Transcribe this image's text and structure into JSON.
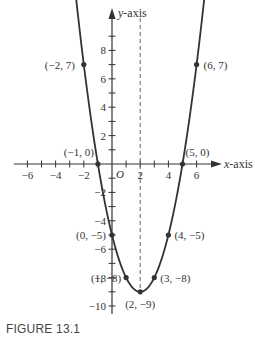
{
  "caption": "FIGURE 13.1",
  "chart_data": {
    "type": "line",
    "title": "",
    "function": "y = x^2 - 4x - 5",
    "xlabel": "x-axis",
    "ylabel": "y-axis",
    "origin_label": "O",
    "xlim": [
      -6.5,
      7.5
    ],
    "ylim": [
      -10.5,
      9.5
    ],
    "x_ticks": [
      -6,
      -4,
      -2,
      2,
      4,
      6
    ],
    "y_ticks": [
      8,
      6,
      4,
      2,
      -2,
      -4,
      -6,
      -8,
      -10
    ],
    "grid": false,
    "axis_of_symmetry": {
      "x": 2,
      "style": "dashed"
    },
    "points": [
      {
        "x": -2,
        "y": 7,
        "label": "(−2, 7)"
      },
      {
        "x": -1,
        "y": 0,
        "label": "(−1, 0)"
      },
      {
        "x": 0,
        "y": -5,
        "label": "(0, −5)"
      },
      {
        "x": 1,
        "y": -8,
        "label": "(1, −8)"
      },
      {
        "x": 2,
        "y": -9,
        "label": "(2, −9)"
      },
      {
        "x": 3,
        "y": -8,
        "label": "(3, −8)"
      },
      {
        "x": 4,
        "y": -5,
        "label": "(4, −5)"
      },
      {
        "x": 5,
        "y": 0,
        "label": "(5, 0)"
      },
      {
        "x": 6,
        "y": 7,
        "label": "(6, 7)"
      }
    ],
    "colors": {
      "curve": "#333333",
      "axes": "#333333",
      "dashed": "#666666"
    }
  }
}
